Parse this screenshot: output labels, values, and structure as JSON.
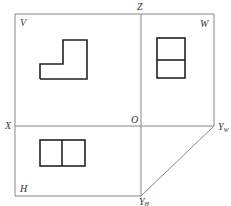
{
  "diagram": {
    "type": "three-view-projection",
    "labels": {
      "V": "V",
      "W": "W",
      "H": "H",
      "X": "X",
      "Z": "Z",
      "O": "O",
      "YW_main": "Y",
      "YW_sub": "W",
      "YH_main": "Y",
      "YH_sub": "H"
    },
    "colors": {
      "frame": "#888888",
      "shape": "#222222",
      "label": "#333333"
    }
  }
}
